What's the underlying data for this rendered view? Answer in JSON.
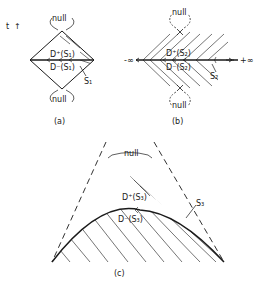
{
  "axis": {
    "time_label": "t",
    "time_arrow": "↑"
  },
  "panels": {
    "a": {
      "caption": "(a)",
      "future_domain": "D⁺(S₁)",
      "past_domain": "D⁻(S₁)",
      "surface": "S₁",
      "null_top": "null",
      "null_bottom": "null"
    },
    "b": {
      "caption": "(b)",
      "future_domain": "D⁺(S₂)",
      "past_domain": "D⁻(S₂)",
      "surface": "S₂",
      "null_top": "null",
      "null_bottom": "null",
      "left_limit": "-∞",
      "right_limit": "+∞"
    },
    "c": {
      "caption": "(c)",
      "future_domain": "D⁺(S₃)",
      "past_domain": "D⁻(S₃)",
      "surface": "S₃",
      "null_label": "null"
    }
  },
  "colors": {
    "ink": "#1a1a1a",
    "background": "#ffffff"
  }
}
